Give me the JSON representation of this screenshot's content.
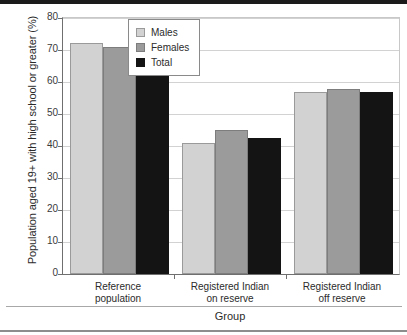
{
  "chart_data": {
    "type": "bar",
    "title": "",
    "xlabel": "Group",
    "ylabel": "Population aged 19+ with high school or greater (%)",
    "categories": [
      "Reference population",
      "Registered Indian on reserve",
      "Registered Indian off reserve"
    ],
    "category_lines": [
      [
        "Reference",
        "population"
      ],
      [
        "Registered Indian",
        "on reserve"
      ],
      [
        "Registered Indian",
        "off reserve"
      ]
    ],
    "series": [
      {
        "name": "Males",
        "color": "#d2d2d2",
        "values": [
          72.3,
          41.0,
          57.0
        ]
      },
      {
        "name": "Females",
        "color": "#9b9b9b",
        "values": [
          71.0,
          45.0,
          57.7
        ]
      },
      {
        "name": "Total",
        "color": "#141414",
        "values": [
          71.5,
          42.5,
          56.8
        ]
      }
    ],
    "ylim": [
      0,
      80
    ],
    "yticks": [
      0,
      10,
      20,
      30,
      40,
      50,
      60,
      70,
      80
    ],
    "ytick_labels": [
      "0",
      "10",
      "20",
      "30",
      "40",
      "50",
      "60",
      "70",
      "80"
    ],
    "grid": true,
    "legend_position": "upper center",
    "legend_entries": [
      "Males",
      "Females",
      "Total"
    ]
  }
}
